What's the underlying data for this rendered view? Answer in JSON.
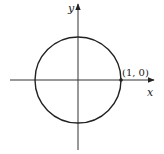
{
  "diagram": {
    "type": "unit-circle",
    "axes": {
      "x_label": "x",
      "y_label": "y"
    },
    "circle": {
      "center": [
        0,
        0
      ],
      "radius": 1
    },
    "point": {
      "label": "(1, 0)",
      "coords": [
        1,
        0
      ]
    },
    "colors": {
      "stroke": "#222222",
      "background": "#ffffff"
    }
  }
}
